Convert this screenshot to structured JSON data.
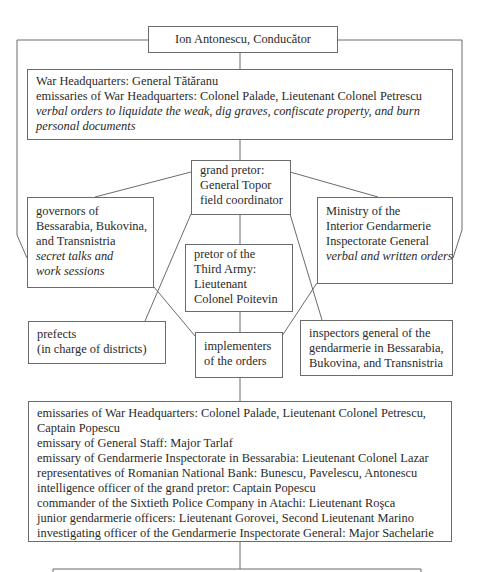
{
  "diagram": {
    "top": {
      "label": "Ion Antonescu, Conducător"
    },
    "war_hq": {
      "lines": [
        "War Headquarters: General Tătăranu",
        "emissaries of War Headquarters: Colonel Palade, Lieutenant Colonel Petrescu"
      ],
      "italic": "verbal orders to liquidate the weak, dig graves, confiscate property, and burn personal documents"
    },
    "grand_pretor": {
      "lines": [
        "grand pretor:",
        "General Topor",
        "field coordinator"
      ]
    },
    "governors": {
      "lines": [
        "governors of",
        "Bessarabia, Bukovina,",
        "and Transnistria"
      ],
      "italic": [
        "secret talks and",
        "work sessions"
      ]
    },
    "ministry": {
      "lines": [
        "Ministry of the",
        "Interior Gendarmerie",
        "Inspectorate General"
      ],
      "italic": [
        "verbal and written orders"
      ]
    },
    "pretor_third_army": {
      "lines": [
        "pretor of the",
        "Third Army:",
        "Lieutenant",
        "Colonel Poitevin"
      ]
    },
    "prefects": {
      "lines": [
        "prefects",
        "(in charge of districts)"
      ]
    },
    "implementers": {
      "lines": [
        "implementers",
        "of the orders"
      ]
    },
    "inspectors": {
      "lines": [
        "inspectors general of the",
        "gendarmerie in Bessarabia,",
        "Bukovina, and Transnistria"
      ]
    },
    "personnel": {
      "lines": [
        "emissaries of War Headquarters: Colonel Palade, Lieutenant Colonel Petrescu,",
        "Captain Popescu",
        "emissary of General Staff: Major Tarlaf",
        "emissary of Gendarmerie Inspectorate in Bessarabia: Lieutenant Colonel Lazar",
        "representatives of Romanian National Bank: Bunescu, Pavelescu, Antonescu",
        "intelligence officer of the grand pretor: Captain Popescu",
        "commander of the Sixtieth Police Company in Atachi: Lieutenant Roşca",
        "junior gendarmerie officers: Lieutenant Gorovei, Second Lieutenant Marino",
        "investigating officer of the Gendarmerie Inspectorate General: Major Sachelarie"
      ]
    }
  }
}
